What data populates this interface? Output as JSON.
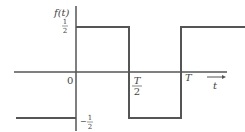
{
  "diagram": {
    "type": "square-wave",
    "function_label": "f(t)",
    "y_labels": {
      "top_num": "1",
      "top_den": "2",
      "bottom_sign": "−",
      "bottom_num": "1",
      "bottom_den": "2"
    },
    "x_labels": {
      "origin": "0",
      "half_period_num": "T",
      "half_period_den": "2",
      "period": "T",
      "axis_var": "t"
    },
    "levels": {
      "high": 0.5,
      "low": -0.5
    },
    "segments": [
      {
        "from": "t<0",
        "value": -0.5
      },
      {
        "from": "0",
        "to": "T/2",
        "value": 0.5
      },
      {
        "from": "T/2",
        "to": "T",
        "value": -0.5
      },
      {
        "from": "T",
        "to": ">T",
        "value": 0.5
      }
    ],
    "colors": {
      "line": "#555555",
      "text": "#444444"
    }
  }
}
